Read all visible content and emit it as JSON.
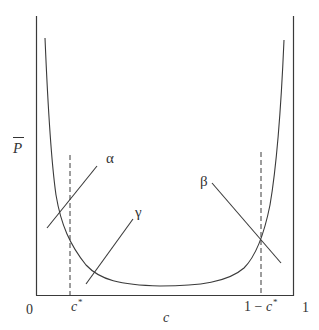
{
  "figure": {
    "y_axis_label": "P",
    "x_axis_label": "c",
    "x_ticks": {
      "origin": "0",
      "c_star_base": "c",
      "c_star_sup": "*",
      "one_minus_prefix": "1 − ",
      "one_minus_base": "c",
      "one_minus_sup": "*",
      "one": "1"
    },
    "line_labels": {
      "alpha": "α",
      "beta": "β",
      "gamma": "γ"
    },
    "colors": {
      "ink": "#3a3a3a",
      "background": "#ffffff"
    }
  }
}
